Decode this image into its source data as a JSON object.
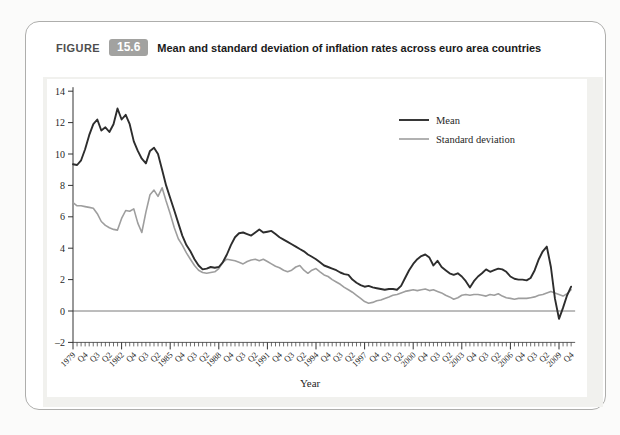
{
  "figure": {
    "label": "FIGURE",
    "number": "15.6",
    "title": "Mean and standard deviation of inflation rates across euro area countries"
  },
  "colors": {
    "mean_line": "#2d2d2d",
    "stdev_line": "#9e9e9e",
    "badge_bg": "#a2a2a0",
    "panel_bg": "#f1f1ee",
    "zero_line": "#7a7a7a",
    "axis": "#333333"
  },
  "chart_data": {
    "type": "line",
    "title": "Mean and standard deviation of inflation rates across euro area countries",
    "xlabel": "Year",
    "ylabel": "",
    "ylim": [
      -2,
      14
    ],
    "y_ticks": [
      "14",
      "12",
      "10",
      "8",
      "6",
      "4",
      "2",
      "0",
      "–2"
    ],
    "y_tick_values": [
      14,
      12,
      10,
      8,
      6,
      4,
      2,
      0,
      -2
    ],
    "grid": false,
    "x_unit": "quarter",
    "x_start": "1979Q1",
    "x_end": "2009Q4",
    "x_tick_label_every_n_quarters": 3,
    "x_major_tick_every_n_quarters": 12,
    "x_tick_labels": [
      "1979",
      "Q4",
      "Q3",
      "Q2",
      "1982",
      "Q4",
      "Q3",
      "Q2",
      "1985",
      "Q4",
      "Q3",
      "Q2",
      "1988",
      "Q4",
      "Q3",
      "Q2",
      "1991",
      "Q4",
      "Q3",
      "Q2",
      "1994",
      "Q4",
      "Q3",
      "Q2",
      "1997",
      "Q4",
      "Q3",
      "Q2",
      "2000",
      "Q4",
      "Q3",
      "Q2",
      "2003",
      "Q4",
      "Q3",
      "Q2",
      "2006",
      "Q4",
      "Q3",
      "Q2",
      "2009",
      "Q4"
    ],
    "legend_position": "upper right inside",
    "series": [
      {
        "name": "Mean",
        "color": "#2d2d2d",
        "values": [
          9.35,
          9.3,
          9.6,
          10.3,
          11.2,
          11.9,
          12.2,
          11.5,
          11.7,
          11.4,
          11.9,
          12.9,
          12.2,
          12.5,
          11.9,
          10.8,
          10.2,
          9.7,
          9.4,
          10.2,
          10.4,
          10.0,
          9.0,
          8.0,
          7.2,
          6.4,
          5.6,
          4.8,
          4.2,
          3.8,
          3.3,
          2.9,
          2.65,
          2.7,
          2.8,
          2.75,
          2.8,
          3.1,
          3.6,
          4.2,
          4.7,
          4.95,
          5.0,
          4.9,
          4.8,
          5.0,
          5.2,
          5.0,
          5.05,
          5.1,
          4.9,
          4.7,
          4.55,
          4.4,
          4.25,
          4.1,
          3.95,
          3.8,
          3.6,
          3.45,
          3.3,
          3.1,
          2.9,
          2.8,
          2.7,
          2.6,
          2.45,
          2.35,
          2.3,
          2.0,
          1.8,
          1.65,
          1.55,
          1.6,
          1.5,
          1.45,
          1.4,
          1.35,
          1.4,
          1.4,
          1.35,
          1.6,
          2.1,
          2.6,
          3.0,
          3.3,
          3.5,
          3.6,
          3.4,
          2.9,
          3.2,
          2.8,
          2.6,
          2.4,
          2.3,
          2.4,
          2.2,
          1.9,
          1.5,
          1.9,
          2.2,
          2.4,
          2.65,
          2.5,
          2.6,
          2.7,
          2.65,
          2.5,
          2.2,
          2.05,
          2.0,
          2.0,
          1.95,
          2.1,
          2.6,
          3.3,
          3.8,
          4.1,
          2.8,
          0.8,
          -0.5,
          0.2,
          1.0,
          1.55
        ]
      },
      {
        "name": "Standard deviation",
        "color": "#9e9e9e",
        "values": [
          6.9,
          6.7,
          6.7,
          6.65,
          6.6,
          6.55,
          6.2,
          5.7,
          5.45,
          5.3,
          5.2,
          5.15,
          5.9,
          6.4,
          6.35,
          6.5,
          5.6,
          5.0,
          6.3,
          7.4,
          7.7,
          7.3,
          7.85,
          7.0,
          6.2,
          5.3,
          4.6,
          4.2,
          3.7,
          3.3,
          2.9,
          2.6,
          2.45,
          2.4,
          2.45,
          2.5,
          2.7,
          3.1,
          3.3,
          3.25,
          3.2,
          3.1,
          3.0,
          3.15,
          3.25,
          3.3,
          3.2,
          3.3,
          3.15,
          3.0,
          2.85,
          2.75,
          2.6,
          2.5,
          2.6,
          2.8,
          2.9,
          2.6,
          2.4,
          2.6,
          2.7,
          2.5,
          2.3,
          2.2,
          2.0,
          1.85,
          1.7,
          1.5,
          1.35,
          1.2,
          1.0,
          0.8,
          0.6,
          0.5,
          0.55,
          0.65,
          0.7,
          0.8,
          0.9,
          1.0,
          1.05,
          1.15,
          1.25,
          1.3,
          1.35,
          1.3,
          1.35,
          1.4,
          1.3,
          1.35,
          1.25,
          1.15,
          1.0,
          0.9,
          0.75,
          0.85,
          1.0,
          1.05,
          1.0,
          1.05,
          1.05,
          1.0,
          0.95,
          1.05,
          1.0,
          1.1,
          0.95,
          0.85,
          0.8,
          0.75,
          0.8,
          0.8,
          0.8,
          0.85,
          0.9,
          1.0,
          1.05,
          1.15,
          1.25,
          1.15,
          1.05,
          0.95,
          1.1,
          1.35
        ]
      }
    ]
  }
}
